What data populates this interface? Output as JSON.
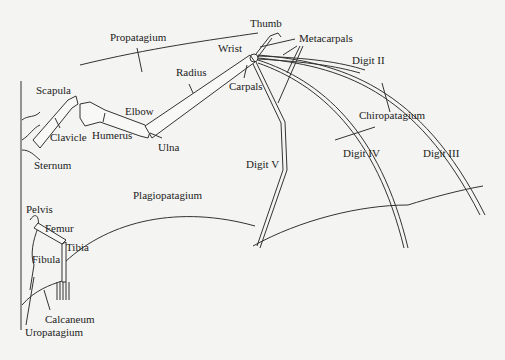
{
  "diagram": {
    "labels": {
      "thumb": "Thumb",
      "metacarpals": "Metacarpals",
      "propatagium": "Propatagium",
      "wrist": "Wrist",
      "digit_ii": "Digit II",
      "radius": "Radius",
      "carpals": "Carpals",
      "scapula": "Scapula",
      "elbow": "Elbow",
      "clavicle": "Clavicle",
      "humerus": "Humerus",
      "ulna": "Ulna",
      "chiropatagium": "Chiropatagium",
      "sternum": "Sternum",
      "digit_v": "Digit V",
      "digit_iv": "Digit IV",
      "digit_iii": "Digit III",
      "plagiopatagium": "Plagiopatagium",
      "pelvis": "Pelvis",
      "femur": "Femur",
      "tibia": "Tibia",
      "fibula": "Fibula",
      "calcaneum": "Calcaneum",
      "uropatagium": "Uropatagium"
    },
    "colors": {
      "background": "#f4f4f2",
      "line": "#333333",
      "text": "#222222"
    }
  }
}
